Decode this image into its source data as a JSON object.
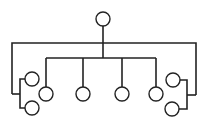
{
  "diagram": {
    "type": "tree",
    "stroke_color": "#222222",
    "background": "#ffffff",
    "node_radius": 7,
    "nodes": [
      {
        "id": "root",
        "x": 103,
        "y": 19
      },
      {
        "id": "mid-1",
        "x": 46,
        "y": 94
      },
      {
        "id": "mid-2",
        "x": 83,
        "y": 94
      },
      {
        "id": "mid-3",
        "x": 122,
        "y": 94
      },
      {
        "id": "mid-4",
        "x": 156,
        "y": 94
      },
      {
        "id": "left-top",
        "x": 32,
        "y": 79
      },
      {
        "id": "left-bottom",
        "x": 32,
        "y": 108
      },
      {
        "id": "right-top",
        "x": 173,
        "y": 80
      },
      {
        "id": "right-bottom",
        "x": 172,
        "y": 109
      }
    ],
    "edges": [
      {
        "from": "root",
        "to": "mid-1"
      },
      {
        "from": "root",
        "to": "mid-2"
      },
      {
        "from": "root",
        "to": "mid-3"
      },
      {
        "from": "root",
        "to": "mid-4"
      },
      {
        "from": "root",
        "to": "left-top"
      },
      {
        "from": "root",
        "to": "left-bottom"
      },
      {
        "from": "root",
        "to": "right-top"
      },
      {
        "from": "root",
        "to": "right-bottom"
      }
    ]
  }
}
